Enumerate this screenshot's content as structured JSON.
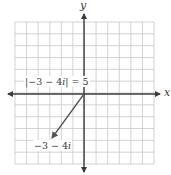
{
  "diagram": {
    "type": "complex-plane-vector",
    "axes": {
      "x_label": "x",
      "y_label": "y"
    },
    "grid": {
      "cells_x": 12,
      "cells_y": 12
    },
    "vector": {
      "from": [
        0,
        0
      ],
      "to": [
        -3,
        -4
      ],
      "color": "#555555"
    },
    "labels": {
      "modulus_prefix": "|−3 − 4",
      "modulus_i": "i",
      "modulus_suffix": "| = 5",
      "point_prefix": "−3 − 4",
      "point_i": "i"
    },
    "colors": {
      "grid": "#c8c8c8",
      "axis": "#3a3a3a",
      "vector": "#555555"
    }
  }
}
